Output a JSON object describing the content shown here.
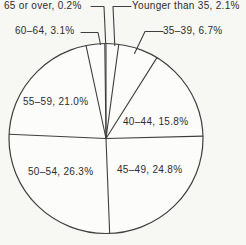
{
  "chart_data": {
    "type": "pie",
    "title": "",
    "unit": "percent",
    "direction": "clockwise",
    "start_angle_deg": 0,
    "slices": [
      {
        "label": "Younger than 35",
        "value": 2.1,
        "display": "Younger than 35, 2.1%"
      },
      {
        "label": "35–39",
        "value": 6.7,
        "display": "35–39, 6.7%"
      },
      {
        "label": "40–44",
        "value": 15.8,
        "display": "40–44, 15.8%"
      },
      {
        "label": "45–49",
        "value": 24.8,
        "display": "45–49, 24.8%"
      },
      {
        "label": "50–54",
        "value": 26.3,
        "display": "50–54, 26.3%"
      },
      {
        "label": "55–59",
        "value": 21.0,
        "display": "55–59, 21.0%"
      },
      {
        "label": "60–64",
        "value": 3.1,
        "display": "60–64, 3.1%"
      },
      {
        "label": "65 or over",
        "value": 0.2,
        "display": "65 or over, 0.2%"
      }
    ],
    "colors": {
      "stroke": "#3f3f3f",
      "fill": "#fcfcfa",
      "text": "#2d2d2d",
      "background": "#f7f7f4"
    },
    "legend": "none",
    "labels_style": "callout-and-inside"
  }
}
